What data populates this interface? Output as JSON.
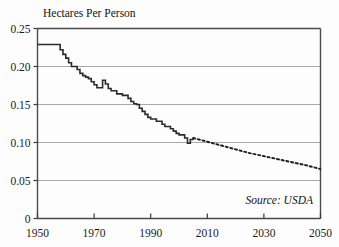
{
  "chart_data": {
    "type": "line",
    "title": "Hectares Per Person",
    "xlabel": "",
    "ylabel": "Hectares Per Person",
    "xlim": [
      1950,
      2050
    ],
    "ylim": [
      0,
      0.25
    ],
    "grid": true,
    "legend": null,
    "annotations": [
      {
        "text": "Source: USDA",
        "x": 2030,
        "y": 0.022,
        "style": "italic"
      }
    ],
    "yticks": [
      0,
      0.05,
      0.1,
      0.15,
      0.2,
      0.25
    ],
    "ytick_labels": [
      "0",
      "0.05",
      "0.10",
      "0.15",
      "0.20",
      "0.25"
    ],
    "xticks": [
      1950,
      1970,
      1990,
      2010,
      2030,
      2050
    ],
    "xtick_labels": [
      "1950",
      "1970",
      "1990",
      "2010",
      "2030",
      "2050"
    ],
    "series": [
      {
        "name": "Grain area per person (historical)",
        "style": "solid",
        "color": "#2b2b2b",
        "x": [
          1950,
          1951,
          1952,
          1953,
          1954,
          1955,
          1956,
          1957,
          1958,
          1959,
          1960,
          1961,
          1962,
          1963,
          1964,
          1965,
          1966,
          1967,
          1968,
          1969,
          1970,
          1971,
          1972,
          1973,
          1974,
          1975,
          1976,
          1977,
          1978,
          1979,
          1980,
          1981,
          1982,
          1983,
          1984,
          1985,
          1986,
          1987,
          1988,
          1989,
          1990,
          1991,
          1992,
          1993,
          1994,
          1995,
          1996,
          1997,
          1998,
          1999,
          2000,
          2001,
          2002,
          2003,
          2004,
          2005
        ],
        "values": [
          0.229,
          0.229,
          0.229,
          0.229,
          0.229,
          0.229,
          0.229,
          0.229,
          0.222,
          0.216,
          0.211,
          0.205,
          0.2,
          0.2,
          0.196,
          0.191,
          0.188,
          0.186,
          0.184,
          0.18,
          0.176,
          0.172,
          0.172,
          0.182,
          0.177,
          0.171,
          0.168,
          0.168,
          0.164,
          0.164,
          0.162,
          0.162,
          0.158,
          0.154,
          0.151,
          0.15,
          0.145,
          0.141,
          0.137,
          0.133,
          0.131,
          0.131,
          0.128,
          0.128,
          0.124,
          0.121,
          0.121,
          0.118,
          0.115,
          0.112,
          0.11,
          0.11,
          0.106,
          0.099,
          0.104,
          0.106
        ]
      },
      {
        "name": "Projection",
        "style": "dotted",
        "color": "#1f1f1f",
        "x": [
          2005,
          2010,
          2015,
          2020,
          2025,
          2030,
          2035,
          2040,
          2045,
          2050
        ],
        "values": [
          0.106,
          0.101,
          0.096,
          0.091,
          0.086,
          0.082,
          0.078,
          0.074,
          0.07,
          0.065
        ]
      }
    ]
  },
  "annotation": {
    "source": "Source: USDA"
  },
  "title": {
    "text": "Hectares Per Person"
  }
}
